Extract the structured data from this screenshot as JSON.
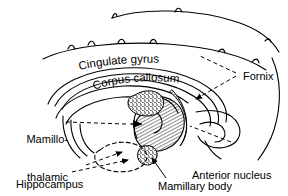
{
  "figure": {
    "type": "anatomical-line-diagram",
    "background_color": "#ffffff",
    "line_color": "#000000",
    "labels": {
      "cingulate_gyrus": "Cingulate gyrus",
      "corpus_callosum": "Corpus callosum",
      "fornix": "Fornix",
      "mamillothalamic_tract_line1": "Mamillo-",
      "mamillothalamic_tract_line2": "thalamic",
      "mamillothalamic_tract_line3": "tract",
      "anterior_nucleus_line1": "Anterior nucleus",
      "anterior_nucleus_line2": "of thalamus",
      "hippocampus": "Hippocampus",
      "mamillary_body": "Mamillary body"
    },
    "structures": [
      "outer cortical arc with gyral notches",
      "cingulate gyrus arc with gyral notches",
      "corpus callosum banded arc",
      "fornix hooked body with hatching",
      "anterior nucleus of thalamus (stippled)",
      "mamillary body (stippled)",
      "hippocampus (dashed outline)",
      "splenium and brainstem curves"
    ],
    "leader_lines": [
      {
        "from": "Fornix",
        "to": "fornix body",
        "style": "dashed-arrow"
      },
      {
        "from": "Fornix",
        "to": "upper fornix arc",
        "style": "dashed"
      },
      {
        "from": "Mamillo-thalamic tract",
        "to": "tract region",
        "style": "dashed-arrow"
      },
      {
        "from": "Anterior nucleus of thalamus",
        "to": "stippled nucleus",
        "style": "dashed-arrow"
      },
      {
        "from": "Hippocampus",
        "to": "dashed hippocampal outline",
        "style": "dashed-arrow"
      },
      {
        "from": "Mamillary body",
        "to": "mamillary body",
        "style": "solid-arrow"
      }
    ]
  }
}
